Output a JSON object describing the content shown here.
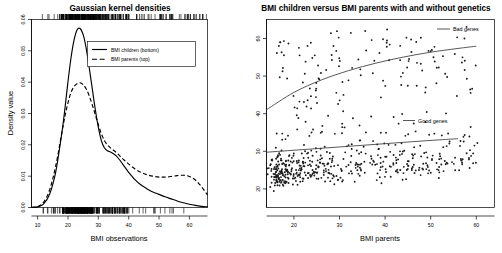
{
  "figure": {
    "background": "#ffffff",
    "foreground": "#000000"
  },
  "left": {
    "title": "Gaussian kernel densities",
    "xlabel": "BMI observations",
    "ylabel": "Density value",
    "xticks": [
      "10",
      "20",
      "30",
      "40",
      "50",
      "60"
    ],
    "yticks": [
      "0.00",
      "0.01",
      "0.02",
      "0.03",
      "0.04",
      "0.05",
      "0.06"
    ],
    "legend": [
      {
        "label": "BMI children (bottom)",
        "style": "solid"
      },
      {
        "label": "BMI parents (top)",
        "style": "dashed"
      }
    ]
  },
  "right": {
    "title": "BMI children versus BMI parents with and without genetics",
    "xlabel": "BMI parents",
    "ylabel": "BMI children",
    "xticks": [
      "20",
      "30",
      "40",
      "50",
      "60"
    ],
    "yticks": [
      "20",
      "30",
      "40",
      "50",
      "60"
    ],
    "annotations": [
      {
        "label": "Bad genes"
      },
      {
        "label": "Good genes"
      }
    ]
  },
  "chart_data": [
    {
      "type": "line",
      "id": "gaussian-kernel-densities",
      "title": "Gaussian kernel densities",
      "xlabel": "BMI observations",
      "ylabel": "Density value",
      "xlim": [
        8,
        66
      ],
      "ylim": [
        0.0,
        0.063
      ],
      "grid": false,
      "legend_position": "top-right",
      "x": [
        8,
        10,
        12,
        14,
        16,
        18,
        19,
        20,
        21,
        22,
        23,
        24,
        25,
        26,
        27,
        28,
        29,
        30,
        31,
        32,
        33,
        34,
        35,
        36,
        37,
        38,
        39,
        40,
        42,
        44,
        46,
        48,
        50,
        52,
        54,
        56,
        58,
        60,
        62,
        64,
        66
      ],
      "series": [
        {
          "name": "BMI children (bottom)",
          "style": "solid",
          "values": [
            0.0,
            0.0002,
            0.0012,
            0.0045,
            0.012,
            0.025,
            0.033,
            0.042,
            0.05,
            0.056,
            0.0595,
            0.06,
            0.058,
            0.0535,
            0.047,
            0.04,
            0.033,
            0.027,
            0.0225,
            0.02,
            0.019,
            0.0186,
            0.018,
            0.0172,
            0.016,
            0.0146,
            0.0132,
            0.0118,
            0.0094,
            0.0076,
            0.0063,
            0.0052,
            0.0044,
            0.0036,
            0.0029,
            0.0022,
            0.0016,
            0.0011,
            0.0007,
            0.0004,
            0.0002
          ]
        },
        {
          "name": "BMI parents (top)",
          "style": "dashed",
          "values": [
            0.0,
            0.0003,
            0.0018,
            0.006,
            0.014,
            0.025,
            0.0305,
            0.035,
            0.0385,
            0.0405,
            0.0415,
            0.0418,
            0.0412,
            0.0398,
            0.0375,
            0.0345,
            0.0312,
            0.0278,
            0.0248,
            0.0225,
            0.021,
            0.02,
            0.0192,
            0.0184,
            0.0174,
            0.0164,
            0.0155,
            0.0146,
            0.013,
            0.0118,
            0.011,
            0.0105,
            0.0102,
            0.0102,
            0.0104,
            0.0107,
            0.0108,
            0.0104,
            0.0092,
            0.007,
            0.0042
          ]
        }
      ],
      "rug_top": "BMI parents observations",
      "rug_bottom": "BMI children observations"
    },
    {
      "type": "scatter",
      "id": "bmi-children-vs-parents",
      "title": "BMI children versus BMI parents with and without genetics",
      "xlabel": "BMI parents",
      "ylabel": "BMI children",
      "xlim": [
        14,
        64
      ],
      "ylim": [
        14,
        64
      ],
      "grid": false,
      "groups": [
        {
          "name": "Bad genes",
          "n": 120,
          "trend": "upper-curve"
        },
        {
          "name": "Good genes",
          "n": 380,
          "trend": "lower-curve"
        }
      ],
      "trend_lines": [
        {
          "name": "Bad genes",
          "x": [
            14,
            20,
            26,
            32,
            38,
            44,
            50,
            56,
            60
          ],
          "y": [
            40.0,
            44.6,
            47.9,
            50.4,
            52.4,
            54.0,
            55.3,
            56.3,
            56.9
          ]
        },
        {
          "name": "Good genes",
          "x": [
            14,
            22,
            30,
            38,
            46,
            52,
            56
          ],
          "y": [
            28.7,
            29.4,
            30.1,
            30.8,
            31.5,
            32.0,
            32.3
          ]
        }
      ]
    }
  ]
}
